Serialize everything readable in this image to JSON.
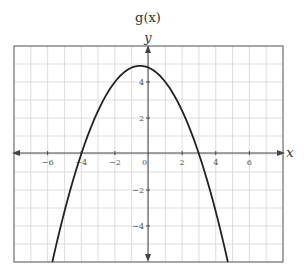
{
  "chart_data": {
    "type": "line",
    "title": "g(x)",
    "xlabel": "x",
    "ylabel": "y",
    "xlim": [
      -8,
      8
    ],
    "ylim": [
      -6,
      6
    ],
    "grid": true,
    "grid_step": 1,
    "x_ticks": [
      -6,
      -4,
      -2,
      0,
      2,
      4,
      6
    ],
    "x_tick_labels": [
      "−6",
      "−4",
      "−2",
      "0",
      "2",
      "4",
      "6"
    ],
    "y_ticks": [
      4,
      2,
      -2,
      -4
    ],
    "y_tick_labels": [
      "4",
      "2",
      "−2",
      "−4"
    ],
    "series": [
      {
        "name": "g(x)",
        "function": "-0.4(x+4)(x-3)",
        "x": [
          -5.72,
          -5,
          -4,
          -3,
          -2,
          -1,
          -0.5,
          0,
          1,
          2,
          3,
          4,
          4.72
        ],
        "y": [
          -6.0,
          -3.2,
          0,
          2.4,
          4.0,
          4.8,
          4.9,
          4.8,
          4.0,
          2.4,
          0,
          -3.2,
          -6.0
        ]
      }
    ],
    "annotations": {
      "vertex": [
        -0.5,
        4.9
      ],
      "roots": [
        -4,
        3
      ],
      "y_intercept": 4.8
    }
  }
}
